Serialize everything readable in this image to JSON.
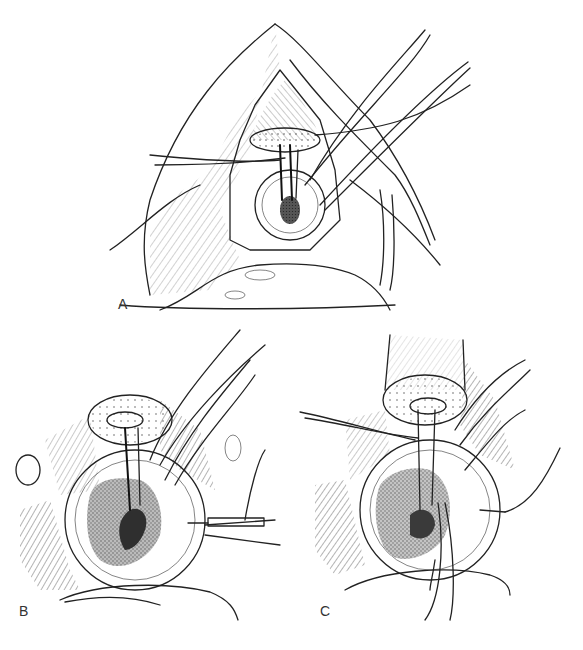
{
  "figure": {
    "panels": [
      {
        "id": "A",
        "label": "A",
        "description": "Overview surgical exposure with retracted tissue flaps, tubular structure with stay sutures"
      },
      {
        "id": "B",
        "label": "B",
        "description": "Close-up view with sutures and needle holder at right"
      },
      {
        "id": "C",
        "label": "C",
        "description": "Close-up view with forceps inserted from below"
      }
    ],
    "colors": {
      "ink": "#222222",
      "background": "#ffffff",
      "dark_fill": "#3a3a3a"
    }
  }
}
